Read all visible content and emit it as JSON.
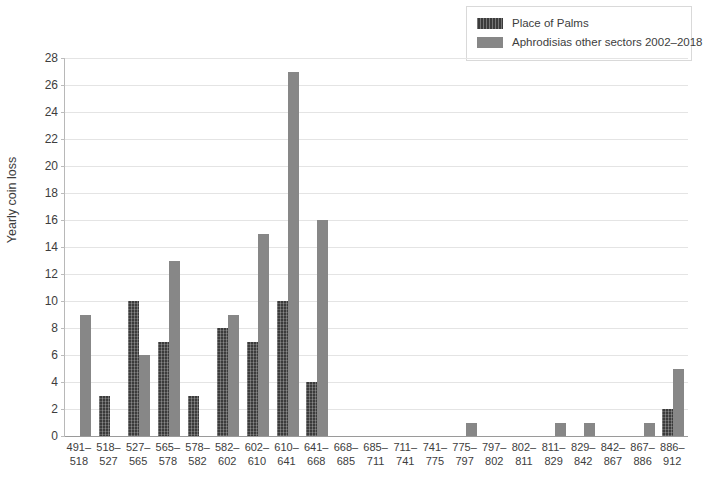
{
  "chart_data": {
    "type": "bar",
    "title": "",
    "xlabel": "",
    "ylabel": "Yearly coin loss",
    "ylim": [
      0,
      28
    ],
    "ytick_step": 2,
    "yticks": [
      0,
      2,
      4,
      6,
      8,
      10,
      12,
      14,
      16,
      18,
      20,
      22,
      24,
      26,
      28
    ],
    "grid": true,
    "legend_position": "top-right",
    "categories": [
      "491–518",
      "518–527",
      "527–565",
      "565–578",
      "578–582",
      "582–602",
      "602–610",
      "610–641",
      "641–668",
      "668–685",
      "685–711",
      "711–741",
      "741–775",
      "775–797",
      "797–802",
      "802–811",
      "811–829",
      "829–842",
      "842–867",
      "867–886",
      "886–912"
    ],
    "series": [
      {
        "name": "Place of Palms",
        "color": "#3b3b3b",
        "values": [
          0,
          3,
          10,
          7,
          3,
          8,
          7,
          10,
          4,
          0,
          0,
          0,
          0,
          0,
          0,
          0,
          0,
          0,
          0,
          0,
          2
        ]
      },
      {
        "name": "Aphrodisias other sectors 2002–2018",
        "color": "#878787",
        "values": [
          9,
          0,
          6,
          13,
          0,
          9,
          15,
          27,
          16,
          0,
          0,
          0,
          0,
          1,
          0,
          0,
          1,
          1,
          0,
          1,
          5
        ]
      }
    ]
  },
  "legend": {
    "items": [
      {
        "label": "Place of Palms",
        "swatch": "dark-hatched-swatch"
      },
      {
        "label": "Aphrodisias other sectors 2002–2018",
        "swatch": "gray-solid-swatch"
      }
    ]
  },
  "axis": {
    "y_title": "Yearly coin loss"
  }
}
